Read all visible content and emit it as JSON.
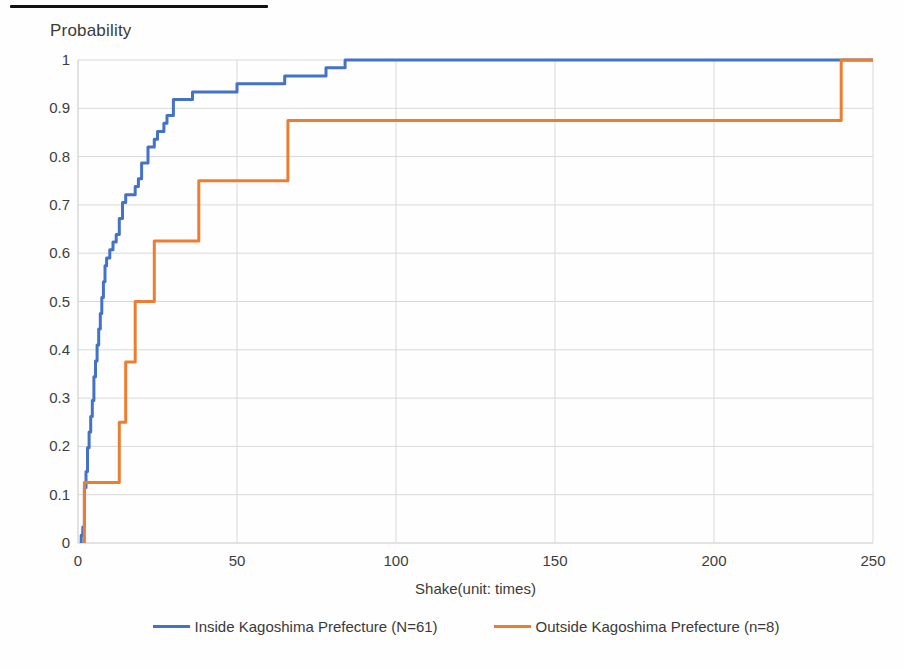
{
  "artifacts": {
    "top_scan_line": "black horizontal scan edge line at top-left"
  },
  "chart_data": {
    "type": "line",
    "subtype": "ecdf-step",
    "title": "",
    "ylabel": "Probability",
    "xlabel": "Shake(unit: times)",
    "xlim": [
      0,
      250
    ],
    "ylim": [
      0,
      1
    ],
    "x_ticks": [
      "0",
      "50",
      "100",
      "150",
      "200",
      "250"
    ],
    "y_ticks": [
      "0",
      "0.1",
      "0.2",
      "0.3",
      "0.4",
      "0.5",
      "0.6",
      "0.7",
      "0.8",
      "0.9",
      "1"
    ],
    "grid": true,
    "grid_color": "#d9d9d9",
    "axis_line_color": "#c6c6c6",
    "legend_position": "bottom-center",
    "series": [
      {
        "name": "Inside Kagoshima Prefecture (N=61)",
        "color": "#4472C4",
        "n": 61,
        "steps": [
          [
            1,
            0.016
          ],
          [
            1.5,
            0.033
          ],
          [
            2,
            0.115
          ],
          [
            2.5,
            0.148
          ],
          [
            3,
            0.197
          ],
          [
            3.5,
            0.23
          ],
          [
            4,
            0.262
          ],
          [
            4.5,
            0.295
          ],
          [
            5,
            0.344
          ],
          [
            5.5,
            0.377
          ],
          [
            6,
            0.41
          ],
          [
            6.5,
            0.443
          ],
          [
            7,
            0.475
          ],
          [
            7.5,
            0.508
          ],
          [
            8,
            0.541
          ],
          [
            8.5,
            0.574
          ],
          [
            9,
            0.59
          ],
          [
            10,
            0.607
          ],
          [
            11,
            0.623
          ],
          [
            12,
            0.639
          ],
          [
            13,
            0.672
          ],
          [
            14,
            0.705
          ],
          [
            15,
            0.721
          ],
          [
            18,
            0.738
          ],
          [
            19,
            0.754
          ],
          [
            20,
            0.787
          ],
          [
            22,
            0.82
          ],
          [
            24,
            0.836
          ],
          [
            25,
            0.852
          ],
          [
            27,
            0.869
          ],
          [
            28,
            0.885
          ],
          [
            30,
            0.918
          ],
          [
            36,
            0.934
          ],
          [
            50,
            0.951
          ],
          [
            65,
            0.967
          ],
          [
            78,
            0.984
          ],
          [
            84,
            1
          ]
        ]
      },
      {
        "name": "Outside Kagoshima Prefecture (n=8)",
        "color": "#ED7D31",
        "n": 8,
        "steps": [
          [
            2,
            0.125
          ],
          [
            13,
            0.25
          ],
          [
            15,
            0.375
          ],
          [
            18,
            0.5
          ],
          [
            24,
            0.625
          ],
          [
            38,
            0.75
          ],
          [
            66,
            0.875
          ],
          [
            240,
            1
          ]
        ]
      }
    ]
  }
}
